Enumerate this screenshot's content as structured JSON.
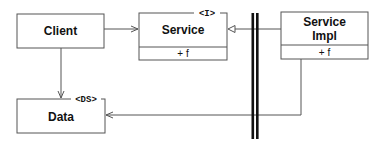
{
  "diagram": {
    "type": "uml-class",
    "nodes": [
      {
        "id": "client",
        "label": "Client",
        "stereotype": "",
        "members": []
      },
      {
        "id": "service",
        "label": "Service",
        "stereotype": "<I>",
        "members": [
          "+ f"
        ]
      },
      {
        "id": "service_impl",
        "label_line1": "Service",
        "label_line2": "Impl",
        "stereotype": "",
        "members": [
          "+ f"
        ]
      },
      {
        "id": "data",
        "label": "Data",
        "stereotype": "<DS>",
        "members": []
      }
    ],
    "edges": [
      {
        "from": "client",
        "to": "service",
        "kind": "association",
        "arrow": "open"
      },
      {
        "from": "service_impl",
        "to": "service",
        "kind": "realization",
        "arrow": "hollow-triangle"
      },
      {
        "from": "client",
        "to": "data",
        "kind": "association",
        "arrow": "open"
      },
      {
        "from": "service_impl",
        "to": "data",
        "kind": "association",
        "arrow": "open"
      }
    ],
    "boundary": {
      "kind": "double-bar",
      "description": "package/layer boundary"
    },
    "colors": {
      "line": "#555555",
      "boundary": "#111111",
      "text": "#111111",
      "background": "#ffffff"
    }
  }
}
